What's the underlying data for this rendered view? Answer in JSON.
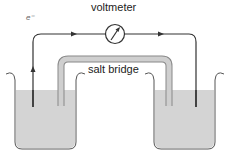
{
  "diagram": {
    "labels": {
      "voltmeter": "voltmeter",
      "salt_bridge": "salt bridge",
      "electron": "e⁻"
    },
    "components": [
      "left beaker",
      "right beaker",
      "left electrode",
      "right electrode",
      "salt bridge",
      "voltmeter",
      "external wire"
    ],
    "colors": {
      "wire": "#333333",
      "solution": "#d4d4d4",
      "beaker_outline": "#555555",
      "salt_bridge_fill": "#c8c8c8"
    }
  }
}
